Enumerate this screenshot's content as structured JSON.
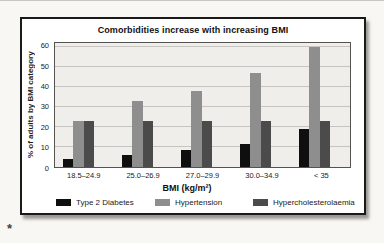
{
  "page": {
    "annotation_mark": "*"
  },
  "chart_data": {
    "type": "bar",
    "title": "Comorbidities increase with increasing BMI",
    "xlabel": "BMI (kg/m²)",
    "ylabel": "% of adults by BMI category",
    "categories": [
      "18.5–24.9",
      "25.0–26.9",
      "27.0–29.9",
      "30.0–34.9",
      "< 35"
    ],
    "series": [
      {
        "name": "Type 2 Diabetes",
        "color": "#0f0f0f",
        "values": [
          4,
          6,
          8.5,
          11.5,
          19
        ]
      },
      {
        "name": "Hypertension",
        "color": "#8e8e8e",
        "values": [
          23,
          33,
          38,
          47,
          60
        ]
      },
      {
        "name": "Hypercholesterolaemia",
        "color": "#4b4b4b",
        "values": [
          23,
          23,
          23,
          23,
          23
        ]
      }
    ],
    "ylim": [
      0,
      60
    ],
    "yticks": [
      0,
      10,
      20,
      30,
      40,
      50,
      60
    ],
    "grid": true,
    "legend_position": "bottom",
    "colors": {
      "plot_background": "#efeeeb",
      "gridline": "#c6c4c0",
      "plot_border": "#55534f",
      "figure_border": "#1a1a1a"
    }
  }
}
